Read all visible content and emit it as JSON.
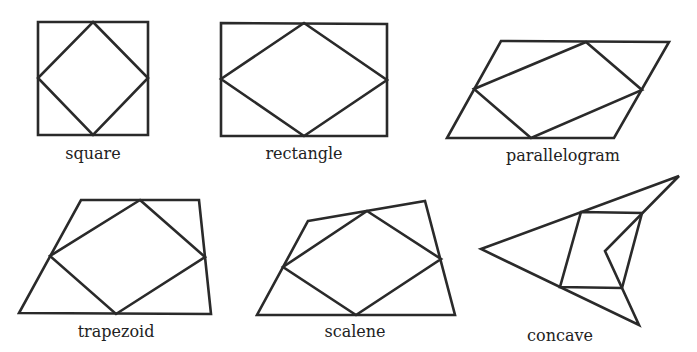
{
  "figures": [
    {
      "id": "square",
      "label": "square",
      "outer": [
        [
          38,
          22
        ],
        [
          148,
          22
        ],
        [
          148,
          135
        ],
        [
          38,
          135
        ]
      ],
      "inner": [
        [
          93,
          22
        ],
        [
          148,
          78
        ],
        [
          93,
          135
        ],
        [
          38,
          78
        ]
      ]
    },
    {
      "id": "rectangle",
      "label": "rectangle",
      "outer": [
        [
          221,
          23
        ],
        [
          387,
          24
        ],
        [
          387,
          136
        ],
        [
          221,
          136
        ]
      ],
      "inner": [
        [
          304,
          23
        ],
        [
          387,
          80
        ],
        [
          304,
          136
        ],
        [
          221,
          79
        ]
      ]
    },
    {
      "id": "parallelogram",
      "label": "parallelogram",
      "outer": [
        [
          501,
          41
        ],
        [
          669,
          42
        ],
        [
          614,
          138
        ],
        [
          447,
          138
        ]
      ],
      "inner": [
        [
          586,
          42
        ],
        [
          642,
          90
        ],
        [
          531,
          138
        ],
        [
          474,
          89
        ]
      ]
    },
    {
      "id": "trapezoid",
      "label": "trapezoid",
      "outer": [
        [
          81,
          200
        ],
        [
          199,
          200
        ],
        [
          211,
          314
        ],
        [
          19,
          313
        ]
      ],
      "inner": [
        [
          140,
          200
        ],
        [
          205,
          257
        ],
        [
          116,
          314
        ],
        [
          50,
          256
        ]
      ]
    },
    {
      "id": "scalene",
      "label": "scalene",
      "outer": [
        [
          308,
          221
        ],
        [
          425,
          201
        ],
        [
          455,
          315
        ],
        [
          257,
          315
        ]
      ],
      "inner": [
        [
          367,
          211
        ],
        [
          441,
          259
        ],
        [
          356,
          315
        ],
        [
          283,
          267
        ]
      ]
    },
    {
      "id": "concave",
      "label": "concave",
      "outer": [
        [
          481,
          249
        ],
        [
          679,
          176
        ],
        [
          605,
          251
        ],
        [
          639,
          325
        ]
      ],
      "inner": [
        [
          581,
          212
        ],
        [
          642,
          213
        ],
        [
          622,
          288
        ],
        [
          560,
          287
        ]
      ]
    }
  ]
}
